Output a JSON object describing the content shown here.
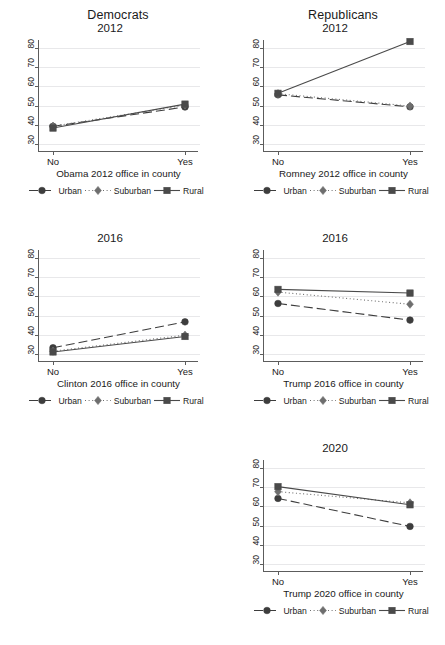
{
  "figure": {
    "columns": [
      {
        "name": "democrats",
        "label": "Democrats"
      },
      {
        "name": "republicans",
        "label": "Republicans"
      }
    ],
    "axis": {
      "y_ticks": [
        30,
        40,
        50,
        60,
        70,
        80
      ],
      "ylim": [
        26,
        84
      ],
      "x_categories": [
        "No",
        "Yes"
      ]
    },
    "legend": {
      "entries": [
        {
          "name": "urban",
          "label": "Urban",
          "marker": "circle",
          "dash": "long-dash",
          "color": "#3d3d3d"
        },
        {
          "name": "suburban",
          "label": "Suburban",
          "marker": "diamond",
          "dash": "dotted",
          "color": "#6e6e6e"
        },
        {
          "name": "rural",
          "label": "Rural",
          "marker": "square",
          "dash": "solid",
          "color": "#4a4a4a"
        }
      ]
    }
  },
  "chart_data": [
    {
      "id": "dem-2012",
      "type": "line",
      "title": "2012",
      "column": "Democrats",
      "xlabel": "Obama 2012 office in county",
      "ylabel": "",
      "categories": [
        "No",
        "Yes"
      ],
      "ylim": [
        26,
        84
      ],
      "yticks": [
        30,
        40,
        50,
        60,
        70,
        80
      ],
      "grid": true,
      "legend_position": "bottom",
      "series": [
        {
          "name": "Urban",
          "values": [
            39.3,
            49.3
          ]
        },
        {
          "name": "Suburban",
          "values": [
            39.4,
            50.3
          ]
        },
        {
          "name": "Rural",
          "values": [
            38.4,
            50.8
          ]
        }
      ]
    },
    {
      "id": "rep-2012",
      "type": "line",
      "title": "2012",
      "column": "Republicans",
      "xlabel": "Romney 2012 office in county",
      "ylabel": "",
      "categories": [
        "No",
        "Yes"
      ],
      "ylim": [
        26,
        84
      ],
      "yticks": [
        30,
        40,
        50,
        60,
        70,
        80
      ],
      "grid": true,
      "legend_position": "bottom",
      "series": [
        {
          "name": "Urban",
          "values": [
            55.6,
            49.4
          ]
        },
        {
          "name": "Suburban",
          "values": [
            56.2,
            49.8
          ]
        },
        {
          "name": "Rural",
          "values": [
            56.4,
            83.2
          ]
        }
      ]
    },
    {
      "id": "dem-2016",
      "type": "line",
      "title": "2016",
      "column": "Democrats",
      "xlabel": "Clinton 2016 office in county",
      "ylabel": "",
      "categories": [
        "No",
        "Yes"
      ],
      "ylim": [
        26,
        84
      ],
      "yticks": [
        30,
        40,
        50,
        60,
        70,
        80
      ],
      "grid": true,
      "legend_position": "bottom",
      "series": [
        {
          "name": "Urban",
          "values": [
            33.4,
            46.8
          ]
        },
        {
          "name": "Suburban",
          "values": [
            31.6,
            39.9
          ]
        },
        {
          "name": "Rural",
          "values": [
            31.2,
            39.2
          ]
        }
      ]
    },
    {
      "id": "rep-2016",
      "type": "line",
      "title": "2016",
      "column": "Republicans",
      "xlabel": "Trump 2016 office in county",
      "ylabel": "",
      "categories": [
        "No",
        "Yes"
      ],
      "ylim": [
        26,
        84
      ],
      "yticks": [
        30,
        40,
        50,
        60,
        70,
        80
      ],
      "grid": true,
      "legend_position": "bottom",
      "series": [
        {
          "name": "Urban",
          "values": [
            56.3,
            47.7
          ]
        },
        {
          "name": "Suburban",
          "values": [
            62.2,
            55.9
          ]
        },
        {
          "name": "Rural",
          "values": [
            63.6,
            61.7
          ]
        }
      ]
    },
    {
      "id": "rep-2020",
      "type": "line",
      "title": "2020",
      "column": "Republicans",
      "xlabel": "Trump 2020 office in county",
      "ylabel": "",
      "categories": [
        "No",
        "Yes"
      ],
      "ylim": [
        26,
        84
      ],
      "yticks": [
        30,
        40,
        50,
        60,
        70,
        80
      ],
      "grid": true,
      "legend_position": "bottom",
      "series": [
        {
          "name": "Urban",
          "values": [
            64.1,
            49.6
          ]
        },
        {
          "name": "Suburban",
          "values": [
            67.6,
            61.8
          ]
        },
        {
          "name": "Rural",
          "values": [
            70.2,
            60.8
          ]
        }
      ]
    }
  ]
}
